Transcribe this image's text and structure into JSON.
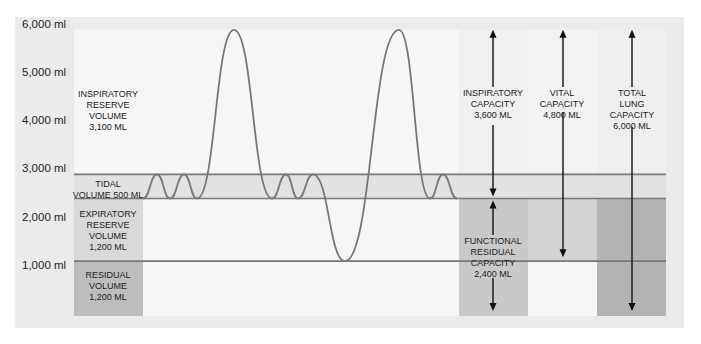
{
  "diagram": {
    "type": "spirogram",
    "unit": "ml",
    "y_axis": {
      "range": [
        0,
        6000
      ],
      "ticks": [
        {
          "value": 6000,
          "label": "6,000 ml"
        },
        {
          "value": 5000,
          "label": "5,000 ml"
        },
        {
          "value": 4000,
          "label": "4,000 ml"
        },
        {
          "value": 3000,
          "label": "3,000 ml"
        },
        {
          "value": 2000,
          "label": "2,000 ml"
        },
        {
          "value": 1000,
          "label": "1,000 ml"
        }
      ]
    },
    "levels_ml": {
      "total": 6000,
      "tidal_top": 3000,
      "tidal_bottom": 2500,
      "residual_top": 1200
    },
    "volumes": [
      {
        "id": "irv",
        "lines": [
          "INSPIRATORY",
          "RESERVE",
          "VOLUME",
          "3,100 ml"
        ],
        "value_ml": 3100
      },
      {
        "id": "tv",
        "lines": [
          "TIDAL",
          "VOLUME 500 ml"
        ],
        "value_ml": 500
      },
      {
        "id": "erv",
        "lines": [
          "EXPIRATORY",
          "RESERVE",
          "VOLUME",
          "1,200 ml"
        ],
        "value_ml": 1200
      },
      {
        "id": "rv",
        "lines": [
          "RESIDUAL",
          "VOLUME",
          "1,200 ml"
        ],
        "value_ml": 1200
      }
    ],
    "capacities": [
      {
        "id": "ic",
        "lines": [
          "INSPIRATORY",
          "CAPACITY",
          "3,600 ml"
        ],
        "value_ml": 3600,
        "from_ml": 2500,
        "to_ml": 6000
      },
      {
        "id": "vc",
        "lines": [
          "VITAL",
          "CAPACITY",
          "4,800 ml"
        ],
        "value_ml": 4800,
        "from_ml": 1200,
        "to_ml": 6000
      },
      {
        "id": "tlc",
        "lines": [
          "TOTAL",
          "LUNG",
          "CAPACITY",
          "6,000 ml"
        ],
        "value_ml": 6000,
        "from_ml": 0,
        "to_ml": 6000
      },
      {
        "id": "frc",
        "lines": [
          "FUNCTIONAL",
          "RESIDUAL",
          "CAPACITY",
          "2,400 ml"
        ],
        "value_ml": 2400,
        "from_ml": 0,
        "to_ml": 2500
      }
    ],
    "waveform_ml": [
      2500,
      3000,
      2500,
      3000,
      2500,
      6000,
      2500,
      3000,
      2500,
      3000,
      1200,
      6000,
      2500,
      3000,
      2500
    ],
    "colors": {
      "panel": "#ebebeb",
      "plot": "#f6f6f6",
      "tidal_band": "#e2e2e2",
      "erv_box": "#d9d9d9",
      "rv_box": "#bdbdbd",
      "frc_col": "#c9c9c9",
      "vc_col": "#d3d3d3",
      "tlc_col": "#b3b3b3",
      "line": "#777777",
      "arrow": "#111111"
    }
  }
}
